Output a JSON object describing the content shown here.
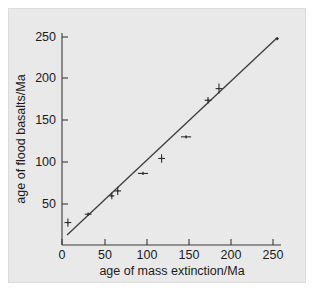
{
  "chart_data": {
    "type": "scatter",
    "title": "",
    "xlabel": "age of mass extinction/Ma",
    "ylabel": "age of flood basalts/Ma",
    "xlim": [
      0,
      265
    ],
    "ylim": [
      0,
      265
    ],
    "xticks": [
      0,
      50,
      100,
      150,
      200,
      250
    ],
    "yticks": [
      50,
      100,
      150,
      200,
      250
    ],
    "xtick_labels": [
      "0",
      "50",
      "100",
      "150",
      "200",
      "250"
    ],
    "ytick_labels": [
      "50",
      "100",
      "150",
      "200",
      "250"
    ],
    "grid": false,
    "legend": null,
    "series": [
      {
        "name": "flood basalt vs mass extinction ages",
        "marker": "point-with-error-bars",
        "points": [
          {
            "x": 7,
            "y": 27,
            "xerr": 4,
            "yerr": 5
          },
          {
            "x": 31,
            "y": 37,
            "xerr": 4,
            "yerr": 2
          },
          {
            "x": 59,
            "y": 59,
            "xerr": 3,
            "yerr": 4
          },
          {
            "x": 66,
            "y": 65,
            "xerr": 4,
            "yerr": 5
          },
          {
            "x": 96,
            "y": 86,
            "xerr": 6,
            "yerr": 2
          },
          {
            "x": 118,
            "y": 104,
            "xerr": 4,
            "yerr": 5
          },
          {
            "x": 147,
            "y": 130,
            "xerr": 6,
            "yerr": 2
          },
          {
            "x": 173,
            "y": 174,
            "xerr": 4,
            "yerr": 4
          },
          {
            "x": 186,
            "y": 188,
            "xerr": 4,
            "yerr": 6
          },
          {
            "x": 255,
            "y": 248,
            "xerr": 2,
            "yerr": 2
          }
        ]
      }
    ],
    "fit_line": {
      "name": "1:1 reference fit",
      "x_start": 6,
      "y_start": 12,
      "x_end": 255,
      "y_end": 249
    }
  },
  "axes": {
    "x_axis_title": "age of mass extinction/Ma",
    "y_axis_title": "age of flood basalts/Ma"
  }
}
